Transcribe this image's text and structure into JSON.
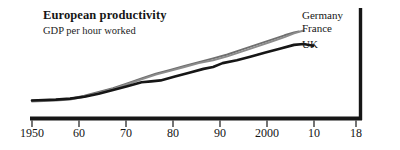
{
  "chart_data": {
    "type": "line",
    "title": "European productivity",
    "subtitle": "GDP per hour worked",
    "xlabel": "",
    "ylabel": "",
    "xlim": [
      1950,
      2018
    ],
    "ylim": [
      0,
      100
    ],
    "grid": false,
    "legend_position": "right",
    "axis_style": "bottom-and-right-rule",
    "ticks": [
      {
        "label": "1950",
        "value": 1950
      },
      {
        "label": "60",
        "value": 1960
      },
      {
        "label": "70",
        "value": 1970
      },
      {
        "label": "80",
        "value": 1980
      },
      {
        "label": "90",
        "value": 1990
      },
      {
        "label": "2000",
        "value": 2000
      },
      {
        "label": "10",
        "value": 2010
      },
      {
        "label": "18",
        "value": 2018
      }
    ],
    "series": [
      {
        "name": "Germany",
        "color": "#6f6f6f",
        "width": 1.9,
        "x": [
          1950,
          1955,
          1958,
          1961,
          1964,
          1967,
          1970,
          1973,
          1976,
          1979,
          1982,
          1985,
          1988,
          1991,
          1994,
          1997,
          2000,
          2003,
          2005,
          2006
        ],
        "values": [
          14,
          15,
          16,
          19,
          23,
          27,
          32,
          37,
          42,
          46,
          50,
          54,
          58,
          62,
          67,
          72,
          77,
          82,
          85,
          86
        ]
      },
      {
        "name": "France",
        "color": "#8c8c8c",
        "width": 1.9,
        "x": [
          1950,
          1955,
          1958,
          1961,
          1964,
          1967,
          1970,
          1973,
          1976,
          1979,
          1982,
          1985,
          1988,
          1991,
          1994,
          1997,
          2000,
          2003,
          2005,
          2007
        ],
        "values": [
          13,
          14,
          15,
          18,
          22,
          26,
          31,
          36,
          41,
          45,
          49,
          53,
          56,
          60,
          65,
          70,
          75,
          80,
          84,
          87
        ]
      },
      {
        "name": "UK",
        "color": "#161616",
        "width": 2.6,
        "x": [
          1950,
          1955,
          1958,
          1961,
          1964,
          1967,
          1970,
          1973,
          1975,
          1977,
          1980,
          1983,
          1986,
          1988,
          1990,
          1993,
          1996,
          1999,
          2002,
          2005,
          2007,
          2009
        ],
        "values": [
          14,
          15,
          16,
          18,
          21,
          25,
          29,
          33,
          34,
          35,
          39,
          43,
          47,
          49,
          53,
          56,
          60,
          64,
          68,
          72,
          73,
          71
        ]
      }
    ]
  },
  "legend": {
    "items": [
      {
        "label": "Germany"
      },
      {
        "label": "France"
      },
      {
        "label": "UK"
      }
    ]
  }
}
